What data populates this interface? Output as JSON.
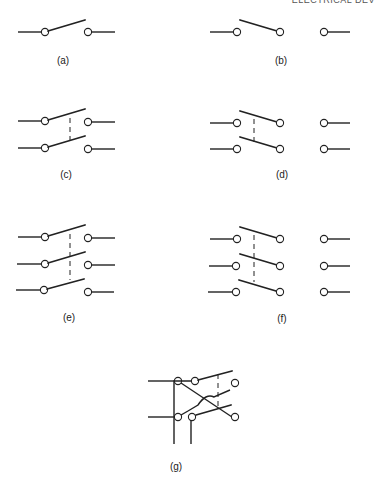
{
  "header": {
    "text": "ELECTRICAL DEV"
  },
  "figure": {
    "panels": [
      {
        "id": "a",
        "label": "(a)",
        "type": "SPST",
        "poles": 1,
        "throws": 1
      },
      {
        "id": "b",
        "label": "(b)",
        "type": "SPDT",
        "poles": 1,
        "throws": 2
      },
      {
        "id": "c",
        "label": "(c)",
        "type": "DPST",
        "poles": 2,
        "throws": 1
      },
      {
        "id": "d",
        "label": "(d)",
        "type": "DPDT",
        "poles": 2,
        "throws": 2
      },
      {
        "id": "e",
        "label": "(e)",
        "type": "3PST",
        "poles": 3,
        "throws": 1
      },
      {
        "id": "f",
        "label": "(f)",
        "type": "3PDT",
        "poles": 3,
        "throws": 2
      },
      {
        "id": "g",
        "label": "(g)",
        "type": "DPDT reversing",
        "poles": 2,
        "throws": 2
      }
    ]
  }
}
